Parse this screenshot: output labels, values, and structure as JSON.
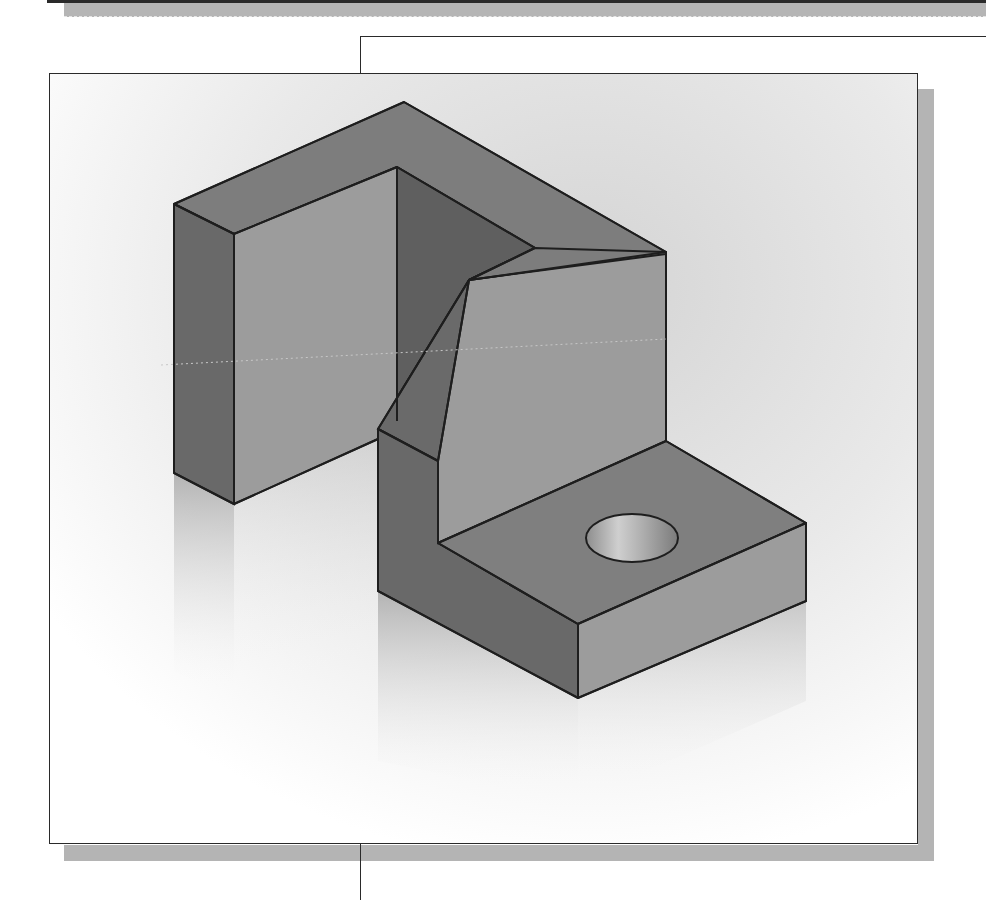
{
  "page": {
    "type": "textbook figure",
    "text_content": []
  },
  "figure": {
    "render_style": "shaded with black edges, floor reflection",
    "colors": {
      "edge": "#1e1e1e",
      "top_face": "#7d7d7d",
      "dark_face": "#6a6a6a",
      "light_face": "#9c9c9c",
      "hole_inner": "#b8b8b8",
      "background_gradient_start": "#d6d6d6",
      "background_gradient_end": "#ffffff",
      "frame_shadow": "#b4b4b4",
      "frame_border": "#2a2a2a"
    },
    "features": [
      "left-upright",
      "rear-top-bar",
      "u-slot",
      "angled-chamfer",
      "base-plate",
      "through-hole"
    ]
  }
}
